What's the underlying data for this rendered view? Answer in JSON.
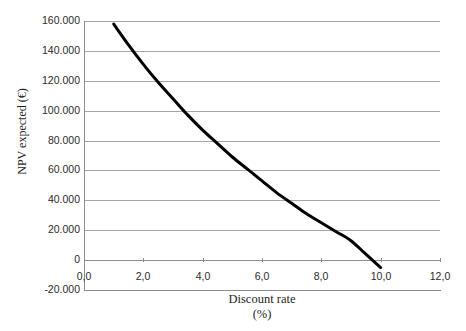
{
  "chart_data": {
    "type": "line",
    "title": "",
    "xlabel": "Discount rate",
    "xlabel_unit": "(%)",
    "ylabel": "NPV expected  (€)",
    "xlim": [
      0.0,
      12.0
    ],
    "ylim": [
      -20000,
      160000
    ],
    "grid": true,
    "legend": null,
    "x_tick_labels": [
      "0,0",
      "2,0",
      "4,0",
      "6,0",
      "8,0",
      "10,0",
      "12,0"
    ],
    "x_tick_values": [
      0.0,
      2.0,
      4.0,
      6.0,
      8.0,
      10.0,
      12.0
    ],
    "y_tick_labels": [
      "-20.000",
      "0",
      "20.000",
      "40.000",
      "60.000",
      "80.000",
      "100.000",
      "120.000",
      "140.000",
      "160.000"
    ],
    "y_tick_values": [
      -20000,
      0,
      20000,
      40000,
      60000,
      80000,
      100000,
      120000,
      140000,
      160000
    ],
    "series": [
      {
        "name": "NPV expected",
        "color": "#000000",
        "line_width": 3,
        "x": [
          1.0,
          1.5,
          2.0,
          2.5,
          3.0,
          3.5,
          4.0,
          4.5,
          5.0,
          5.5,
          6.0,
          6.5,
          7.0,
          7.5,
          8.0,
          8.5,
          9.0,
          9.5,
          10.0
        ],
        "values": [
          158000,
          144000,
          131000,
          119000,
          108000,
          97000,
          87000,
          78000,
          69000,
          61000,
          53000,
          45000,
          38000,
          31000,
          25000,
          19000,
          13000,
          4000,
          -5000
        ]
      }
    ]
  },
  "axis": {
    "y_title": "NPV expected  (€)",
    "x_title": "Discount rate",
    "x_unit": "(%)"
  }
}
